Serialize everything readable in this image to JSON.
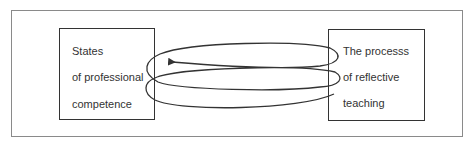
{
  "diagram": {
    "left_box": {
      "lines": [
        "States",
        "of professional",
        "competence"
      ]
    },
    "right_box": {
      "lines": [
        "The processs",
        "of reflective",
        "teaching"
      ]
    },
    "connector": {
      "type": "spiral-coil",
      "direction": "right-to-left",
      "arrowhead": "left",
      "stroke_color": "#333333"
    },
    "colors": {
      "frame_border": "#8a8a8a",
      "box_border": "#333333",
      "text": "#333333",
      "background": "#ffffff"
    }
  }
}
